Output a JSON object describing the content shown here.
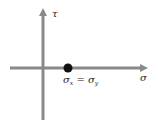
{
  "diagram": {
    "type": "mohr-circle-point",
    "axes": {
      "horizontal_label": "σ",
      "vertical_label": "τ",
      "color": "#8a8a8a"
    },
    "point": {
      "label_main": "σ",
      "label_sub1": "x",
      "label_eq": " = σ",
      "label_sub2": "y",
      "color": "#111111"
    }
  }
}
